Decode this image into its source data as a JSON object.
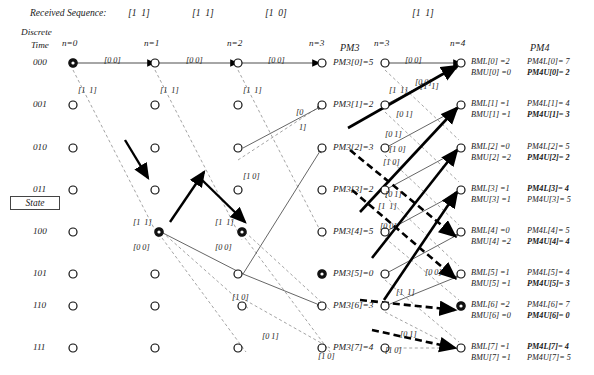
{
  "header": {
    "received_sequence_label": "Received Sequence:",
    "received_symbols": [
      "[1  1]",
      "[1  1]",
      "[1  0]",
      "[1  1]"
    ],
    "discrete_time_line1": "Discrete",
    "discrete_time_line2": "Time",
    "stage_labels": [
      "n=0",
      "n=1",
      "n=2",
      "n=3",
      "n=3",
      "n=4"
    ],
    "pm3_title": "PM3",
    "pm4_title": "PM4",
    "state_box_label": "State"
  },
  "states": [
    "000",
    "001",
    "010",
    "011",
    "100",
    "101",
    "110",
    "111"
  ],
  "branch_labels": {
    "zero_zero": "[0 0]",
    "one_one": "[1 1]",
    "zero_one": "[0 1]",
    "one_zero": "[1 0]",
    "zero_one_split_top": "[0",
    "zero_one_split_bottom": "1]"
  },
  "left_trellis_branch_labels": [
    {
      "text": "[0 0]",
      "x": 104,
      "y": 56
    },
    {
      "text": "[0 0]",
      "x": 186,
      "y": 56
    },
    {
      "text": "[0 0]",
      "x": 268,
      "y": 56
    },
    {
      "text": "[1  1]",
      "x": 78,
      "y": 86
    },
    {
      "text": "[1  1]",
      "x": 160,
      "y": 86
    },
    {
      "text": "[1  1]",
      "x": 243,
      "y": 86
    },
    {
      "text": "[1 0]",
      "x": 243,
      "y": 172
    },
    {
      "text": "[1  1]",
      "x": 133,
      "y": 218
    },
    {
      "text": "[1  1]",
      "x": 215,
      "y": 218
    },
    {
      "text": "[0 0]",
      "x": 133,
      "y": 243
    },
    {
      "text": "[0 0]",
      "x": 215,
      "y": 243
    },
    {
      "text": "[1 0]",
      "x": 232,
      "y": 293
    },
    {
      "text": "[0 1]",
      "x": 262,
      "y": 332
    },
    {
      "text": "[1 0]",
      "x": 318,
      "y": 352
    },
    {
      "text": "[0",
      "x": 296,
      "y": 108
    },
    {
      "text": "1]",
      "x": 299,
      "y": 123
    }
  ],
  "right_trellis_branch_labels": [
    {
      "text": "[0 0]",
      "x": 405,
      "y": 56
    },
    {
      "text": "[1  1]",
      "x": 389,
      "y": 86
    },
    {
      "text": "[1  1]",
      "x": 420,
      "y": 82
    },
    {
      "text": "[0 1]",
      "x": 396,
      "y": 110
    },
    {
      "text": "[0 1]",
      "x": 385,
      "y": 130
    },
    {
      "text": "[1 0]",
      "x": 389,
      "y": 145
    },
    {
      "text": "[1 0]",
      "x": 383,
      "y": 158
    },
    {
      "text": "[0 1]",
      "x": 385,
      "y": 190
    },
    {
      "text": "[1  1]",
      "x": 378,
      "y": 202
    },
    {
      "text": "[0 0]",
      "x": 380,
      "y": 222
    },
    {
      "text": "[0 0]",
      "x": 425,
      "y": 268
    },
    {
      "text": "[1  1]",
      "x": 396,
      "y": 288
    },
    {
      "text": "[0 1]",
      "x": 400,
      "y": 330
    },
    {
      "text": "[1 0]",
      "x": 385,
      "y": 346
    },
    {
      "text": "[0 0]",
      "x": 415,
      "y": 78
    }
  ],
  "pm3_values": [
    {
      "label": "PM3[0]=5"
    },
    {
      "label": "PM3[1]=2"
    },
    {
      "label": "PM3[2]=3"
    },
    {
      "label": "PM3[3]=2"
    },
    {
      "label": "PM3[4]=5"
    },
    {
      "label": "PM3[5]=0"
    },
    {
      "label": "PM3[6]=3"
    },
    {
      "label": "PM3[7]=4"
    }
  ],
  "pm4_rows": [
    {
      "bml": "BML[0] =2",
      "bmu": "BMU[0] =0",
      "pm4l": "PM4L[0]= 7",
      "pm4u": "PM4U[0]= 2",
      "bold": "pm4u"
    },
    {
      "bml": "BML[1] =1",
      "bmu": "BMU[1] =1",
      "pm4l": "PM4L[1]= 4",
      "pm4u": "PM4U[1]= 3",
      "bold": "pm4u"
    },
    {
      "bml": "BML[2] =0",
      "bmu": "BMU[2] =2",
      "pm4l": "PM4L[2]= 5",
      "pm4u": "PM4U[2]= 2",
      "bold": "pm4u"
    },
    {
      "bml": "BML[3] =1",
      "bmu": "BMU[3] =1",
      "pm4l": "PM4L[3]= 4",
      "pm4u": "PM4U[3]= 5",
      "bold": "pm4l"
    },
    {
      "bml": "BML[4] =0",
      "bmu": "BMU[4] =2",
      "pm4l": "PM4L[4]= 5",
      "pm4u": "PM4U[4]= 4",
      "bold": "pm4u"
    },
    {
      "bml": "BML[5] =1",
      "bmu": "BMU[5] =1",
      "pm4l": "PM4L[5]= 4",
      "pm4u": "PM4U[5]= 3",
      "bold": "pm4u"
    },
    {
      "bml": "BML[6] =2",
      "bmu": "BMU[6] =0",
      "pm4l": "PM4L[6]= 7",
      "pm4u": "PM4U[6]= 0",
      "bold": "pm4u"
    },
    {
      "bml": "BML[7] =1",
      "bmu": "BMU[7] =1",
      "pm4l": "PM4L[7]= 4",
      "pm4u": "PM4U[7]= 5",
      "bold": "pm4l"
    }
  ],
  "colors": {
    "ink": "#1a1a1a",
    "line_gray": "#808080",
    "dash_gray": "#9a9a9a",
    "solid_black": "#000000"
  },
  "geometry": {
    "left_columns_x": [
      73,
      155,
      238,
      320
    ],
    "right_columns_x": [
      383,
      461
    ],
    "rows_y": [
      63,
      105,
      148,
      190,
      232,
      274,
      306,
      348
    ]
  }
}
